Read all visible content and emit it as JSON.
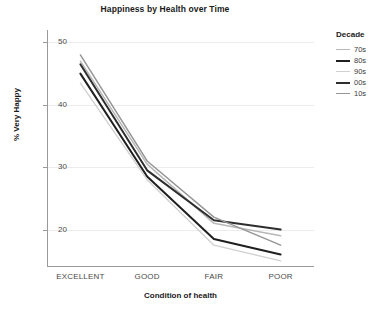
{
  "chart_data": {
    "type": "line",
    "title": "Happiness by Health over Time",
    "xlabel": "Condition of health",
    "ylabel": "% Very Happy",
    "categories": [
      "EXCELLENT",
      "GOOD",
      "FAIR",
      "POOR"
    ],
    "ylim": [
      14,
      52
    ],
    "yticks": [
      20,
      30,
      40,
      50
    ],
    "grid": true,
    "legend_title": "Decade",
    "legend_position": "right",
    "series": [
      {
        "name": "70s",
        "values": [
          47.0,
          30.5,
          21.0,
          19.0
        ],
        "color": "#b8b8b8",
        "width": 1.5
      },
      {
        "name": "80s",
        "values": [
          45.0,
          28.5,
          18.5,
          16.0
        ],
        "color": "#1f1f1f",
        "width": 2.0
      },
      {
        "name": "90s",
        "values": [
          43.5,
          28.0,
          17.5,
          15.0
        ],
        "color": "#d0d0d0",
        "width": 1.3
      },
      {
        "name": "00s",
        "values": [
          46.5,
          29.5,
          21.5,
          20.0
        ],
        "color": "#2e2e2e",
        "width": 2.0
      },
      {
        "name": "10s",
        "values": [
          48.0,
          31.0,
          22.0,
          17.5
        ],
        "color": "#969696",
        "width": 1.5
      }
    ]
  },
  "legend": {
    "title": "Decade",
    "items": [
      {
        "label": "70s"
      },
      {
        "label": "80s"
      },
      {
        "label": "90s"
      },
      {
        "label": "00s"
      },
      {
        "label": "10s"
      }
    ]
  },
  "axes": {
    "ytick_labels": [
      "50",
      "40",
      "30",
      "20"
    ],
    "xtick_labels": [
      "EXCELLENT",
      "GOOD",
      "FAIR",
      "POOR"
    ],
    "ylabel": "% Very Happy",
    "xlabel": "Condition of health"
  },
  "header": {
    "title": "Happiness by Health over Time"
  }
}
